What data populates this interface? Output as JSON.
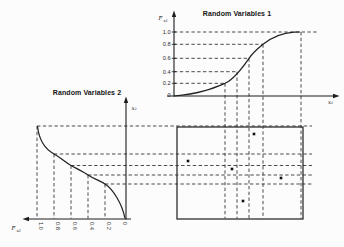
{
  "figure": {
    "bg": "#fcfcfc",
    "ink": "#1c1c1c"
  },
  "top_chart": {
    "title": "Random Variables 1",
    "y_axis_label": {
      "main": "F",
      "sub": "x1"
    },
    "x_axis_label": "x₁",
    "yticks": [
      "1.0",
      "0.8",
      "0.6",
      "0.4",
      "0.2",
      "0"
    ]
  },
  "left_chart": {
    "title": "Random Variables 2",
    "value_axis_label": "x₂",
    "prob_axis_label": {
      "main": "F",
      "sub": "x2"
    },
    "ticks": [
      "1.0",
      "0.8",
      "0.6",
      "0.4",
      "0.2",
      "0"
    ]
  },
  "chart_data": [
    {
      "type": "line",
      "title": "Random Variables 1",
      "ylabel": "Fx1",
      "xlabel": "x1",
      "ylim": [
        0,
        1.0
      ],
      "yticks": [
        1.0,
        0.8,
        0.6,
        0.4,
        0.2,
        0
      ],
      "curve": "cumulative distribution function (sigmoid, increasing)",
      "sampled_probabilities": [
        0.2,
        0.4,
        0.6,
        0.8,
        1.0
      ],
      "inverse_x_px": [
        225,
        237,
        249,
        263,
        301
      ],
      "prob_y_px": [
        83.3,
        71.7,
        58.3,
        44.3,
        32
      ]
    },
    {
      "type": "line",
      "title": "Random Variables 2",
      "xlabel": "Fx2",
      "ylabel": "x2",
      "xticks": [
        1.0,
        0.8,
        0.6,
        0.4,
        0.2,
        0
      ],
      "curve": "cumulative distribution function (rotated: probability axis points left, value axis up, decreasing curve)",
      "sampled_probabilities": [
        0.2,
        0.4,
        0.6,
        0.8,
        1.0
      ],
      "prob_x_px": [
        105,
        88,
        71,
        54,
        37
      ],
      "inverse_y_px": [
        184,
        175,
        165.5,
        154,
        126
      ]
    },
    {
      "type": "scatter",
      "title": "sample space pairings",
      "points_px": [
        [
          254,
          134
        ],
        [
          188,
          161
        ],
        [
          232,
          169
        ],
        [
          243,
          201
        ],
        [
          281,
          178
        ]
      ],
      "grid_cells_col_row": [
        [
          4,
          1
        ],
        [
          1,
          2
        ],
        [
          2,
          3
        ],
        [
          3,
          5
        ],
        [
          5,
          4
        ]
      ]
    }
  ]
}
